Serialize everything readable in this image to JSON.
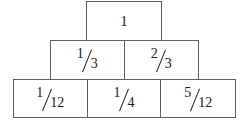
{
  "diagram": {
    "type": "fraction-pyramid",
    "background_color": "#ffffff",
    "line_color": "#5e5e5e",
    "text_color": "#1a1a1a",
    "rows": [
      {
        "row_index": 0,
        "name": "top-row",
        "cells": [
          {
            "label": "1",
            "numerator": "1",
            "denominator": "",
            "is_whole": true
          }
        ]
      },
      {
        "row_index": 1,
        "name": "middle-row",
        "cells": [
          {
            "label": "1/3",
            "numerator": "1",
            "denominator": "3",
            "is_whole": false
          },
          {
            "label": "2/3",
            "numerator": "2",
            "denominator": "3",
            "is_whole": false
          }
        ]
      },
      {
        "row_index": 2,
        "name": "bottom-row",
        "cells": [
          {
            "label": "1/12",
            "numerator": "1",
            "denominator": "12",
            "is_whole": false
          },
          {
            "label": "1/4",
            "numerator": "1",
            "denominator": "4",
            "is_whole": false
          },
          {
            "label": "5/12",
            "numerator": "5",
            "denominator": "12",
            "is_whole": false
          }
        ]
      }
    ]
  }
}
